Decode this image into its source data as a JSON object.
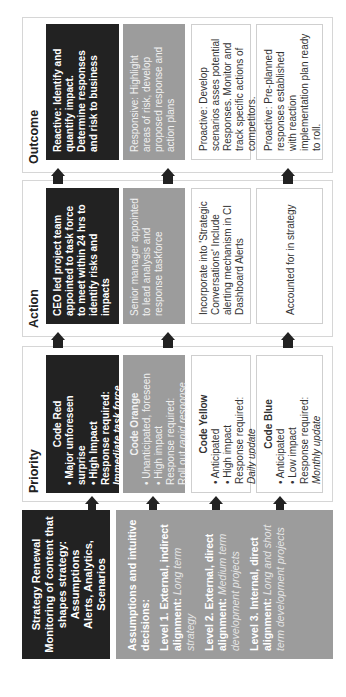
{
  "sections": {
    "outcome": {
      "title": "Outcome",
      "rows": [
        "Reactive: Identify and quantify impact. Determine responses and risk to business",
        "Responsive: Highlight areas of risk, develop proposed response and action plans",
        "Proactive: Develop scenarios asses potential Responses. Monitor and track specific actions of competitors.",
        "Proactive: Pre-planned responses established with reaction implementation plan ready to roll."
      ]
    },
    "action": {
      "title": "Action",
      "rows": [
        "CEO led project team appointed to task force to meet within 24 hrs to identify risks and impacts",
        "Senior manager appointed to lead analysis and response taskforce",
        "Incorporate into 'Strategic Conversations' Include alerting mechanism in CI Dashboard Alerts",
        "Accounted for in strategy"
      ]
    },
    "priority": {
      "title": "Priority",
      "rows": [
        {
          "code": "Code Red",
          "bullets": [
            "Major unforeseen surprise",
            "High Impact"
          ],
          "response_label": "Response required:",
          "response": "Immediate task force"
        },
        {
          "code": "Code Orange",
          "bullets": [
            "Unanticipated, foreseen",
            "High impact"
          ],
          "response_label": "Response required:",
          "response_prefix": "Roll out ",
          "response": "rapid response"
        },
        {
          "code": "Code Yellow",
          "bullets": [
            "Anticipated",
            "High impact"
          ],
          "response_label": "Response required:",
          "response": "Daily update"
        },
        {
          "code": "Code Blue",
          "bullets": [
            "Anticipated",
            "Low impact"
          ],
          "response_label": "Response required:",
          "response": "Monthly update"
        }
      ]
    }
  },
  "inputs": {
    "strategy": {
      "lines": [
        "Strategy Renewal",
        "Monitoring of content that shapes strategy:",
        "Assumptions",
        "Alerts, Analytics,",
        "Scenarios"
      ]
    },
    "assumptions": {
      "heading": "Assumptions and intuitive decisions:",
      "levels": [
        {
          "label": "Level 1. External, indirect alignment:",
          "detail": "Long term strategy"
        },
        {
          "label": "Level 2. External, direct alignment:",
          "detail": "Medium term development projects"
        },
        {
          "label": "Level 3. Internal, direct alignment:",
          "detail": "Long and short term development projects"
        }
      ]
    }
  },
  "colors": {
    "black": "#222222",
    "gray": "#9c9c9c",
    "border": "#d6d6d6"
  }
}
